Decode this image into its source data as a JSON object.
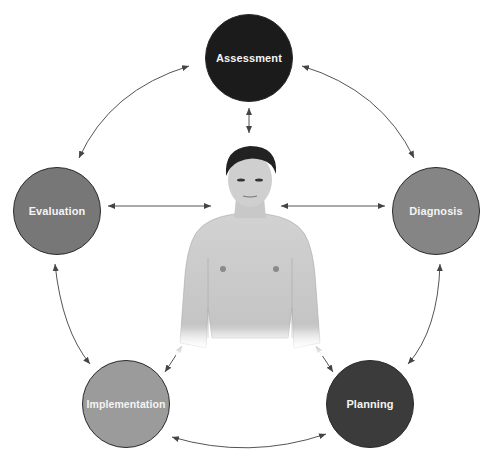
{
  "diagram": {
    "type": "cycle",
    "center": {
      "label": "patient",
      "description": "photo of shirtless young man (center figure)"
    },
    "nodes": [
      {
        "id": "assessment",
        "label": "Assessment",
        "color": "#1b1b1b",
        "cx": 249,
        "cy": 58,
        "r": 44
      },
      {
        "id": "diagnosis",
        "label": "Diagnosis",
        "color": "#858585",
        "cx": 436,
        "cy": 211,
        "r": 44
      },
      {
        "id": "planning",
        "label": "Planning",
        "color": "#3b3b3b",
        "cx": 370,
        "cy": 404,
        "r": 44
      },
      {
        "id": "implementation",
        "label": "Implementation",
        "color": "#9b9b9b",
        "cx": 126,
        "cy": 404,
        "r": 44
      },
      {
        "id": "evaluation",
        "label": "Evaluation",
        "color": "#777777",
        "cx": 57,
        "cy": 211,
        "r": 44
      }
    ],
    "edges": [
      {
        "from": "assessment",
        "to": "diagnosis",
        "direction": "bidirectional",
        "style": "curved"
      },
      {
        "from": "diagnosis",
        "to": "planning",
        "direction": "bidirectional",
        "style": "curved"
      },
      {
        "from": "planning",
        "to": "implementation",
        "direction": "bidirectional",
        "style": "curved"
      },
      {
        "from": "implementation",
        "to": "evaluation",
        "direction": "bidirectional",
        "style": "curved"
      },
      {
        "from": "evaluation",
        "to": "assessment",
        "direction": "bidirectional",
        "style": "curved"
      },
      {
        "from": "assessment",
        "to": "patient",
        "direction": "bidirectional",
        "style": "straight"
      },
      {
        "from": "evaluation",
        "to": "patient",
        "direction": "bidirectional",
        "style": "straight"
      },
      {
        "from": "diagnosis",
        "to": "patient",
        "direction": "bidirectional",
        "style": "straight"
      },
      {
        "from": "implementation",
        "to": "patient",
        "direction": "bidirectional",
        "style": "straight"
      },
      {
        "from": "planning",
        "to": "patient",
        "direction": "bidirectional",
        "style": "straight"
      }
    ],
    "arrow_color": "#444444"
  }
}
